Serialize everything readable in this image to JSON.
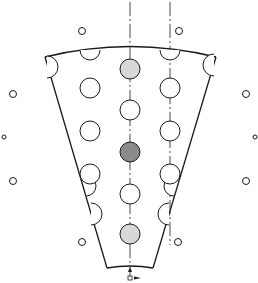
{
  "diagram": {
    "colors": {
      "stroke": "#1a1a1a",
      "light_fill": "#d8d8d8",
      "dark_fill": "#8a8a8a",
      "background": "#ffffff"
    },
    "sector": {
      "top_left": [
        45,
        57
      ],
      "top_right": [
        216,
        57
      ],
      "bottom_left": [
        107,
        268
      ],
      "bottom_right": [
        153,
        268
      ]
    },
    "centerlines": [
      {
        "x": 130,
        "y1": 2,
        "y2": 268
      },
      {
        "x": 170,
        "y1": 2,
        "y2": 245
      }
    ],
    "holes": [
      {
        "cx": 130,
        "cy": 69,
        "r": 10,
        "fill": "light"
      },
      {
        "cx": 90,
        "cy": 88,
        "r": 10,
        "fill": "none"
      },
      {
        "cx": 170,
        "cy": 88,
        "r": 10,
        "fill": "none"
      },
      {
        "cx": 130,
        "cy": 110,
        "r": 10,
        "fill": "none"
      },
      {
        "cx": 90,
        "cy": 131,
        "r": 10,
        "fill": "none"
      },
      {
        "cx": 170,
        "cy": 131,
        "r": 10,
        "fill": "none"
      },
      {
        "cx": 130,
        "cy": 152,
        "r": 10,
        "fill": "dark"
      },
      {
        "cx": 90,
        "cy": 174,
        "r": 10,
        "fill": "none"
      },
      {
        "cx": 170,
        "cy": 174,
        "r": 10,
        "fill": "none"
      },
      {
        "cx": 130,
        "cy": 194,
        "r": 10,
        "fill": "none"
      },
      {
        "cx": 130,
        "cy": 234,
        "r": 10,
        "fill": "light"
      }
    ],
    "edge_half_holes": [
      {
        "cx": 90,
        "cy": 50,
        "r": 10,
        "dir": "down"
      },
      {
        "cx": 170,
        "cy": 50,
        "r": 10,
        "dir": "down"
      },
      {
        "cx": 47,
        "cy": 67,
        "r": 11,
        "dir": "right"
      },
      {
        "cx": 214,
        "cy": 65,
        "r": 11,
        "dir": "left"
      },
      {
        "cx": 91,
        "cy": 214,
        "r": 11,
        "dir": "right"
      },
      {
        "cx": 169,
        "cy": 214,
        "r": 11,
        "dir": "left"
      },
      {
        "cx": 86,
        "cy": 186,
        "r": 10,
        "dir": "right"
      },
      {
        "cx": 174,
        "cy": 186,
        "r": 10,
        "dir": "left"
      }
    ],
    "outer_markers": [
      {
        "cx": 82,
        "cy": 31,
        "r": 3.5
      },
      {
        "cx": 179,
        "cy": 31,
        "r": 3.5
      },
      {
        "cx": 13,
        "cy": 94,
        "r": 3.5
      },
      {
        "cx": 246,
        "cy": 94,
        "r": 3.5
      },
      {
        "cx": 4,
        "cy": 137,
        "r": 2
      },
      {
        "cx": 255,
        "cy": 137,
        "r": 2
      },
      {
        "cx": 13,
        "cy": 181,
        "r": 3.5
      },
      {
        "cx": 246,
        "cy": 181,
        "r": 3.5
      },
      {
        "cx": 82,
        "cy": 242,
        "r": 3.5
      },
      {
        "cx": 178,
        "cy": 242,
        "r": 3.5
      }
    ],
    "indicator": {
      "label": "a",
      "arrow": "up-and-right"
    }
  }
}
